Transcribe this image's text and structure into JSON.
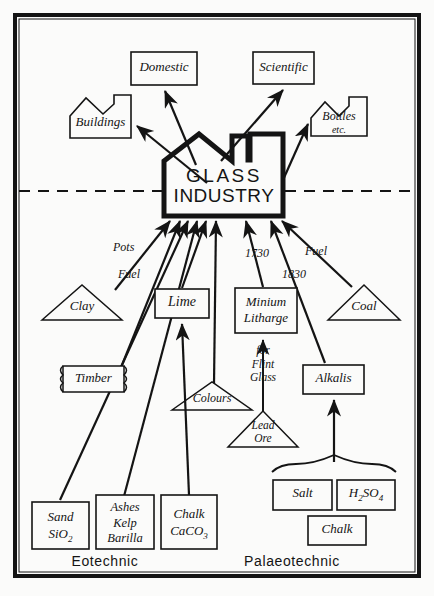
{
  "diagram": {
    "title": "GLASS INDUSTRY",
    "center": {
      "line1": "GLASS",
      "line2": "INDUSTRY"
    },
    "eras": {
      "left": "Eotechnic",
      "right": "Palaeotechnic"
    },
    "outputs": [
      {
        "id": "domestic",
        "label": "Domestic",
        "shape": "rect"
      },
      {
        "id": "scientific",
        "label": "Scientific",
        "shape": "rect"
      },
      {
        "id": "buildings",
        "label": "Buildings",
        "shape": "factory"
      },
      {
        "id": "bottles",
        "label": "Bottles",
        "label2": "etc.",
        "shape": "factory"
      }
    ],
    "inputs": [
      {
        "id": "clay",
        "label": "Clay",
        "shape": "triangle"
      },
      {
        "id": "timber",
        "label": "Timber",
        "shape": "scroll"
      },
      {
        "id": "lime",
        "label": "Lime",
        "shape": "rect"
      },
      {
        "id": "colours",
        "label": "Colours",
        "shape": "triangle"
      },
      {
        "id": "minium",
        "label": "Minium",
        "label2": "Litharge",
        "shape": "rect"
      },
      {
        "id": "coal",
        "label": "Coal",
        "shape": "triangle"
      },
      {
        "id": "leadore",
        "label": "Lead",
        "label2": "Ore",
        "shape": "triangle"
      },
      {
        "id": "alkalis",
        "label": "Alkalis",
        "shape": "rect"
      },
      {
        "id": "sand",
        "label": "Sand",
        "label2": "SiO",
        "sub2": "2",
        "shape": "rect"
      },
      {
        "id": "ashes",
        "label": "Ashes",
        "label2": "Kelp",
        "label3": "Barilla",
        "shape": "rect"
      },
      {
        "id": "chalk1",
        "label": "Chalk",
        "label2": "CaCO",
        "sub2": "3",
        "shape": "rect"
      },
      {
        "id": "salt",
        "label": "Salt",
        "shape": "rect"
      },
      {
        "id": "h2so4",
        "label": "H",
        "sub1": "2",
        "label2": "SO",
        "sub2": "4",
        "shape": "rect"
      },
      {
        "id": "chalk2",
        "label": "Chalk",
        "shape": "rect"
      }
    ],
    "edge_labels": [
      {
        "id": "pots",
        "text": "Pots"
      },
      {
        "id": "fuel1",
        "text": "Fuel"
      },
      {
        "id": "fuel2",
        "text": "Fuel"
      },
      {
        "id": "y1730",
        "text": "1730"
      },
      {
        "id": "y1830",
        "text": "1830"
      },
      {
        "id": "flint",
        "line1": "for",
        "line2": "Flint",
        "line3": "Glass"
      }
    ],
    "colors": {
      "ink": "#141414",
      "paper": "#fbfbfa"
    }
  }
}
